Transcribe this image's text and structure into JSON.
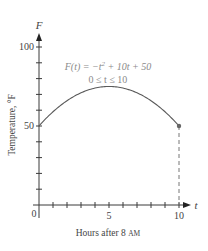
{
  "chart_data": {
    "type": "line",
    "title": "",
    "function": "F(t) = -t^2 + 10t + 50",
    "domain": "0 <= t <= 10",
    "xlabel": "Hours after 8 AM",
    "ylabel": "Temperature, °F",
    "x_axis_symbol": "t",
    "y_axis_symbol": "F",
    "xlim": [
      0,
      10
    ],
    "ylim": [
      0,
      100
    ],
    "x_ticks": [
      0,
      1,
      2,
      3,
      4,
      5,
      6,
      7,
      8,
      9,
      10
    ],
    "x_tick_labels": [
      "0",
      "5",
      "10"
    ],
    "y_ticks": [
      0,
      10,
      20,
      30,
      40,
      50,
      60,
      70,
      80,
      90,
      100
    ],
    "y_tick_labels": [
      "50",
      "100"
    ],
    "grid": false,
    "legend": null,
    "series": [
      {
        "name": "F(t)",
        "x": [
          0,
          1,
          2,
          3,
          4,
          5,
          6,
          7,
          8,
          9,
          10
        ],
        "values": [
          50,
          59,
          66,
          71,
          74,
          75,
          74,
          71,
          66,
          59,
          50
        ]
      }
    ],
    "annotations": [
      {
        "text": "F(t) = −t² + 10t + 50",
        "type": "formula"
      },
      {
        "text": "0 ≤ t ≤ 10",
        "type": "domain"
      },
      {
        "type": "endpoint-dot",
        "x": 10,
        "y": 50
      },
      {
        "type": "dashed-drop-line",
        "x": 10,
        "from_y": 50,
        "to_y": 0
      }
    ]
  },
  "labels": {
    "y_symbol": "F",
    "x_symbol": "t",
    "y_100": "100",
    "y_50": "50",
    "x_0": "0",
    "x_5": "5",
    "x_10": "10",
    "xlabel_main": "Hours after 8 ",
    "xlabel_am": "AM",
    "ylabel": "Temperature, °F",
    "formula_line1_a": "F(t) = −t",
    "formula_line1_sup": "2",
    "formula_line1_b": " + 10t + 50",
    "formula_line2": "0 ≤ t ≤ 10"
  },
  "colors": {
    "axis": "#3a3a3a",
    "curve": "#5a5a5a",
    "formula": "#8a8a8a",
    "dashed": "#777777"
  }
}
